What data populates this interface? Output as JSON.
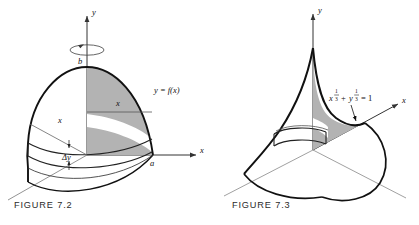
{
  "plate": {
    "background_color": "#ffffff",
    "ink_color": "#111111",
    "shade_color": "#b3b3b3",
    "axis_color": "#4a4a4a"
  },
  "figures": [
    {
      "id": "figure-7-2",
      "caption": "FIGURE 7.2",
      "description": "Solid of revolution generated by revolving the region under y = f(x) about the y-axis, with a cylindrical shell element of thickness delta-y",
      "axes": [
        {
          "name": "y-axis",
          "label": "y",
          "direction": "up"
        },
        {
          "name": "x-axis",
          "label": "x",
          "direction": "right"
        },
        {
          "name": "z-axis",
          "label": "",
          "direction": "lower-left"
        }
      ],
      "labels": {
        "y_axis_label": "y",
        "x_axis_label": "x",
        "curve_label": "y = f(x)",
        "upper_bound": "b",
        "lower_bound": "a",
        "radius_label": "x",
        "top_radius_label": "x",
        "thickness_label": "Δy"
      },
      "annotations": {
        "revolution_arrow": "rotation-ellipse-about-y-axis",
        "shell_element": "washer-slab"
      }
    },
    {
      "id": "figure-7-3",
      "caption": "FIGURE 7.3",
      "description": "Solid of revolution generated by revolving the astroid arc about the y-axis, showing a cusp at the top and a disk element",
      "axes": [
        {
          "name": "y-axis",
          "label": "y",
          "direction": "up"
        },
        {
          "name": "x-axis",
          "label": "x",
          "direction": "upper-right"
        },
        {
          "name": "z-axis",
          "label": "",
          "direction": "lower-left"
        }
      ],
      "labels": {
        "y_axis_label": "y",
        "x_axis_label": "x",
        "equation_base_x": "x",
        "equation_exponent_num": "1",
        "equation_exponent_den": "3",
        "equation_plus": "+",
        "equation_base_y": "y",
        "equation_equals": "= 1",
        "equation_plain": "x^(1/3) + y^(1/3) = 1"
      },
      "annotations": {
        "pointer_arrow": "arrow-to-curve",
        "disk_element": "washer-slab"
      }
    }
  ]
}
